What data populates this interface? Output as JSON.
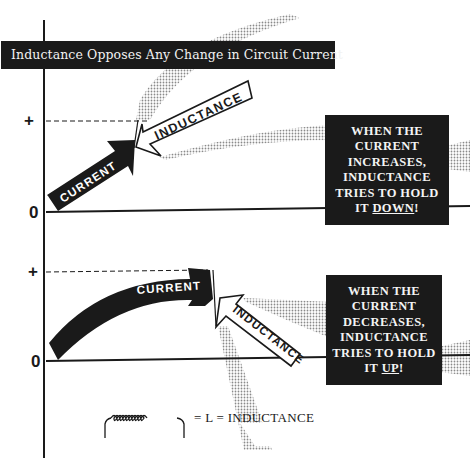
{
  "title": "Inductance Opposes Any Change in Circuit Current",
  "top_graph": {
    "y_plus_label": "+",
    "y_zero_label": "0",
    "current_arrow_label": "CURRENT",
    "inductance_arrow_label": "INDUCTANCE",
    "callout": {
      "line1": "WHEN THE",
      "line2": "CURRENT",
      "line3": "INCREASES,",
      "line4": "INDUCTANCE",
      "line5": "TRIES TO HOLD",
      "line6_prefix": "IT ",
      "line6_emph": "DOWN",
      "line6_suffix": "!"
    }
  },
  "bottom_graph": {
    "y_plus_label": "+",
    "y_zero_label": "0",
    "current_arrow_label": "CURRENT",
    "inductance_arrow_label": "INDUCTANCE",
    "callout": {
      "line1": "WHEN THE",
      "line2": "CURRENT",
      "line3": "DECREASES,",
      "line4": "INDUCTANCE",
      "line5": "TRIES TO HOLD",
      "line6_prefix": "IT ",
      "line6_emph": "UP",
      "line6_suffix": "!"
    }
  },
  "legend": {
    "symbol": "coil-inductor-symbol",
    "text": "= L = INDUCTANCE"
  },
  "colors": {
    "ink": "#1a1a1a",
    "paper": "#ffffff",
    "halftone": "#9a9a9a"
  }
}
